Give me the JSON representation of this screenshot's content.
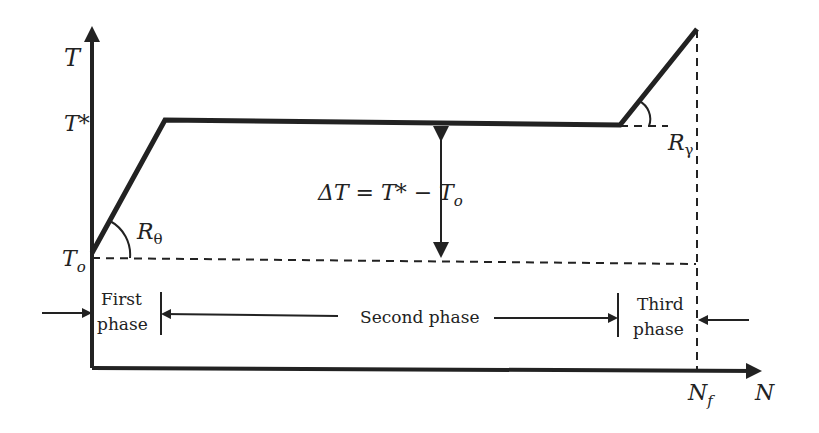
{
  "diagram": {
    "type": "temperature-vs-cycles phases",
    "axes": {
      "y_label": "T",
      "x_label": "N",
      "y_ticks": [
        "T*",
        "To"
      ],
      "x_ticks": [
        "Nf"
      ]
    },
    "labels": {
      "t_axis": "T",
      "t_star": "T*",
      "t_o_main": "T",
      "t_o_sub": "o",
      "r_theta_main": "R",
      "r_theta_sub": "θ",
      "r_gamma_main": "R",
      "r_gamma_sub": "γ",
      "delta_eq": "ΔT = T* − T",
      "delta_eq_sub": "o",
      "n_f_main": "N",
      "n_f_sub": "f",
      "n_axis": "N"
    },
    "phases": [
      {
        "line1": "First",
        "line2": "phase"
      },
      {
        "line1": "Second phase"
      },
      {
        "line1": "Third",
        "line2": "phase"
      }
    ],
    "colors": {
      "stroke": "#222222",
      "background": "#ffffff"
    }
  }
}
